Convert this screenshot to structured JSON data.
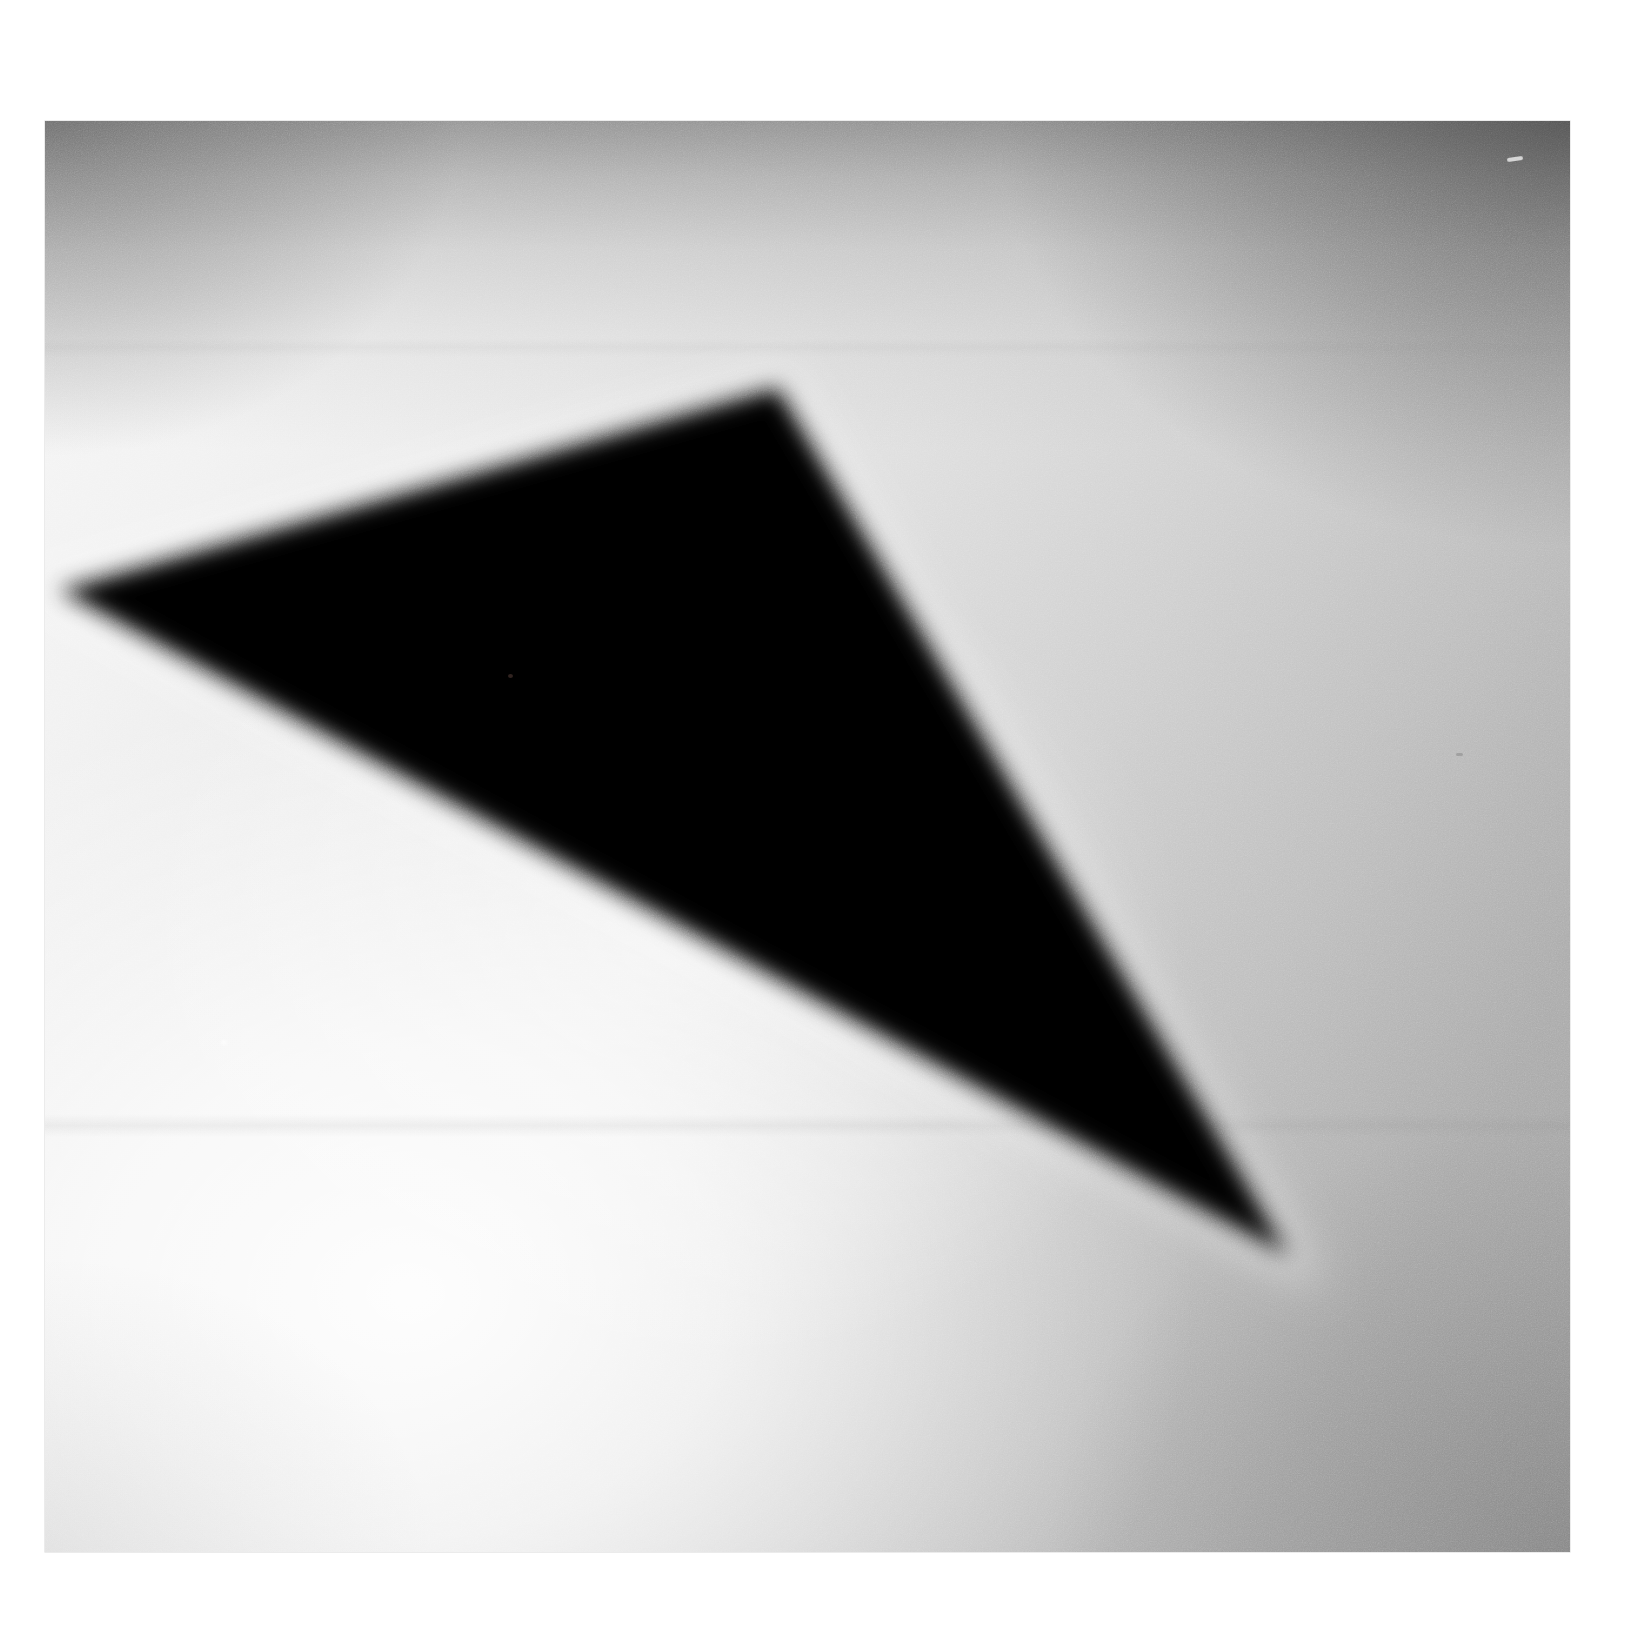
{
  "artwork": {
    "title": "Black triangle on gradient ground",
    "medium": "photographic print",
    "canvas": {
      "width": 1652,
      "height": 1627,
      "background_color": "#ffffff"
    },
    "print": {
      "left": 45,
      "top": 121,
      "width": 1525,
      "height": 1431,
      "border_color": "#ffffff",
      "tones": {
        "brightest_lower_left": "#f6f6f6",
        "mid_right": "#a8a8a8",
        "top_band_dark": "#8d8d8d",
        "upper_left_vignette": "#909090",
        "upper_right_vignette": "#7a7a7a",
        "bottom_center": "#e8e8e8"
      },
      "grain": {
        "visible": true,
        "intensity": "fine"
      },
      "crease_line_y_fraction": 0.7
    },
    "shape": {
      "name": "triangle",
      "fill_color": "#000000",
      "edge_blur_px": 26,
      "halo_color": "#ffffff",
      "vertices": [
        {
          "label": "apex-top",
          "x": 778,
          "y": 387
        },
        {
          "label": "vertex-left",
          "x": 58,
          "y": 590
        },
        {
          "label": "vertex-bottom-right",
          "x": 1290,
          "y": 1257
        }
      ],
      "vertices_print_relative": [
        {
          "label": "apex-top",
          "x": 733,
          "y": 266
        },
        {
          "label": "vertex-left",
          "x": 13,
          "y": 469
        },
        {
          "label": "vertex-bottom-right",
          "x": 1245,
          "y": 1136
        }
      ]
    },
    "defects": [
      {
        "name": "speck-interior",
        "x": 510,
        "y": 676,
        "color": "#3a2a26"
      },
      {
        "name": "speck-topright",
        "x": 1515,
        "y": 159,
        "color": "#e8e8e8"
      },
      {
        "name": "speck-lowerleft",
        "x": 224,
        "y": 1042,
        "color": "#ffffff"
      },
      {
        "name": "speck-rightmid",
        "x": 1459,
        "y": 754,
        "color": "#8a8a8a"
      }
    ]
  }
}
